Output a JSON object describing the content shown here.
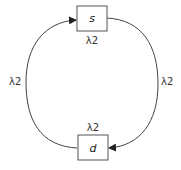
{
  "diagram": {
    "nodes": [
      {
        "id": "s",
        "label": "s",
        "annotation": "λ2"
      },
      {
        "id": "d",
        "label": "d",
        "annotation": "λ2"
      }
    ],
    "edges": [
      {
        "from": "d",
        "to": "s",
        "side": "left",
        "label": "λ2"
      },
      {
        "from": "s",
        "to": "d",
        "side": "right",
        "label": "λ2"
      }
    ],
    "colors": {
      "stroke": "#444444",
      "background": "#ffffff"
    }
  }
}
